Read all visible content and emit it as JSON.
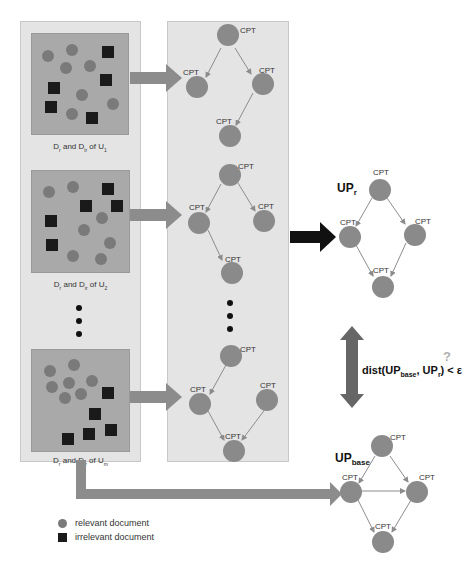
{
  "user_panels": [
    {
      "label": "Dr and Dir of U1",
      "label_parts": {
        "a": "D",
        "a_sub": "r",
        "mid": " and D",
        "b_sub": "ir",
        "end": " of U",
        "u_sub": "1"
      }
    },
    {
      "label": "Dr and Dir of U2",
      "label_parts": {
        "a": "D",
        "a_sub": "r",
        "mid": " and D",
        "b_sub": "ir",
        "end": " of U",
        "u_sub": "2"
      }
    },
    {
      "label": "Dr and Dir of Um",
      "label_parts": {
        "a": "D",
        "a_sub": "r",
        "mid": " and D",
        "b_sub": "ir",
        "end": " of U",
        "u_sub": "m"
      }
    }
  ],
  "node_label": "CPT",
  "up_r": {
    "main": "UP",
    "sub": "r"
  },
  "up_base": {
    "main": "UP",
    "sub": "base"
  },
  "distance": {
    "prefix": "dist(UP",
    "sub1": "base",
    "mid": ", UP",
    "sub2": "r",
    "suffix": ") < ε",
    "question_mark": "?"
  },
  "legend": {
    "relevant": "relevant document",
    "irrelevant": "irrelevant document"
  },
  "colors": {
    "panel_bg": "#e4e4e4",
    "doc_box": "#a9a9a9",
    "relevant": "#7a7a7a",
    "irrelevant": "#1a1a1a",
    "gray_arrow": "#8c8c8c",
    "black_arrow": "#111111"
  }
}
